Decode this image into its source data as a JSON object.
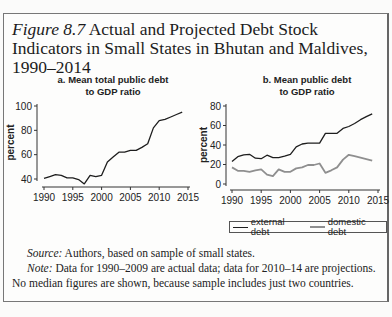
{
  "figure": {
    "label": "Figure 8.7",
    "title": "Actual and Projected Debt Stock Indicators in Small States in Bhutan and Maldives, 1990–2014"
  },
  "panels": {
    "a": {
      "title_line1": "a. Mean total public debt",
      "title_line2": "to GDP ratio"
    },
    "b": {
      "title_line1": "b. Mean public debt",
      "title_line2": "to GDP ratio"
    }
  },
  "legend": {
    "external": "external debt",
    "domestic": "domestic debt"
  },
  "caption": {
    "source_label": "Source:",
    "source_text": " Authors, based on sample of small states.",
    "note_label": "Note:",
    "note_text": " Data for 1990–2009 are actual data; data for 2010–14 are projections. No median figures are shown, because sample includes just two countries."
  },
  "colors": {
    "external": "#1e1e1e",
    "domestic": "#8f8f8f",
    "axis": "#333333"
  },
  "chart_data": [
    {
      "type": "line",
      "title": "a. Mean total public debt to GDP ratio",
      "xlabel": "",
      "ylabel": "percent",
      "xlim": [
        1990,
        2015
      ],
      "ylim": [
        36,
        100
      ],
      "xticks": [
        1990,
        1995,
        2000,
        2005,
        2010,
        2015
      ],
      "yticks": [
        40,
        60,
        80,
        100
      ],
      "grid": false,
      "x": [
        1990,
        1991,
        1992,
        1993,
        1994,
        1995,
        1996,
        1997,
        1998,
        1999,
        2000,
        2001,
        2002,
        2003,
        2004,
        2005,
        2006,
        2007,
        2008,
        2009,
        2010,
        2011,
        2012,
        2013,
        2014
      ],
      "series": [
        {
          "name": "total public debt",
          "values": [
            40.5,
            42,
            43.5,
            43,
            41,
            41,
            39.5,
            36,
            43,
            42,
            43,
            54,
            58,
            62,
            62,
            63.5,
            63.5,
            66,
            69,
            82,
            88,
            89,
            91,
            93,
            95
          ]
        }
      ]
    },
    {
      "type": "line",
      "title": "b. Mean public debt to GDP ratio",
      "xlabel": "",
      "ylabel": "percent",
      "xlim": [
        1990,
        2015
      ],
      "ylim": [
        0,
        80
      ],
      "xticks": [
        1990,
        1995,
        2000,
        2005,
        2010,
        2015
      ],
      "yticks": [
        0,
        20,
        40,
        60,
        80
      ],
      "grid": false,
      "legend_position": "bottom",
      "x": [
        1990,
        1991,
        1992,
        1993,
        1994,
        1995,
        1996,
        1997,
        1998,
        1999,
        2000,
        2001,
        2002,
        2003,
        2004,
        2005,
        2006,
        2007,
        2008,
        2009,
        2010,
        2011,
        2012,
        2013,
        2014
      ],
      "series": [
        {
          "name": "external debt",
          "values": [
            23,
            28,
            30,
            30.5,
            26.5,
            26,
            29.5,
            27,
            27,
            28.5,
            30.5,
            38,
            41,
            42,
            42,
            42,
            52,
            52,
            52,
            57,
            59,
            62,
            66,
            69,
            72
          ]
        },
        {
          "name": "domestic debt",
          "values": [
            17,
            13.5,
            13.5,
            12.5,
            14,
            15,
            9.5,
            8,
            15,
            12.5,
            12.5,
            16,
            17,
            19.5,
            19.5,
            21,
            11.5,
            14,
            17,
            25,
            30,
            28.5,
            27,
            25.5,
            24
          ]
        }
      ]
    }
  ]
}
